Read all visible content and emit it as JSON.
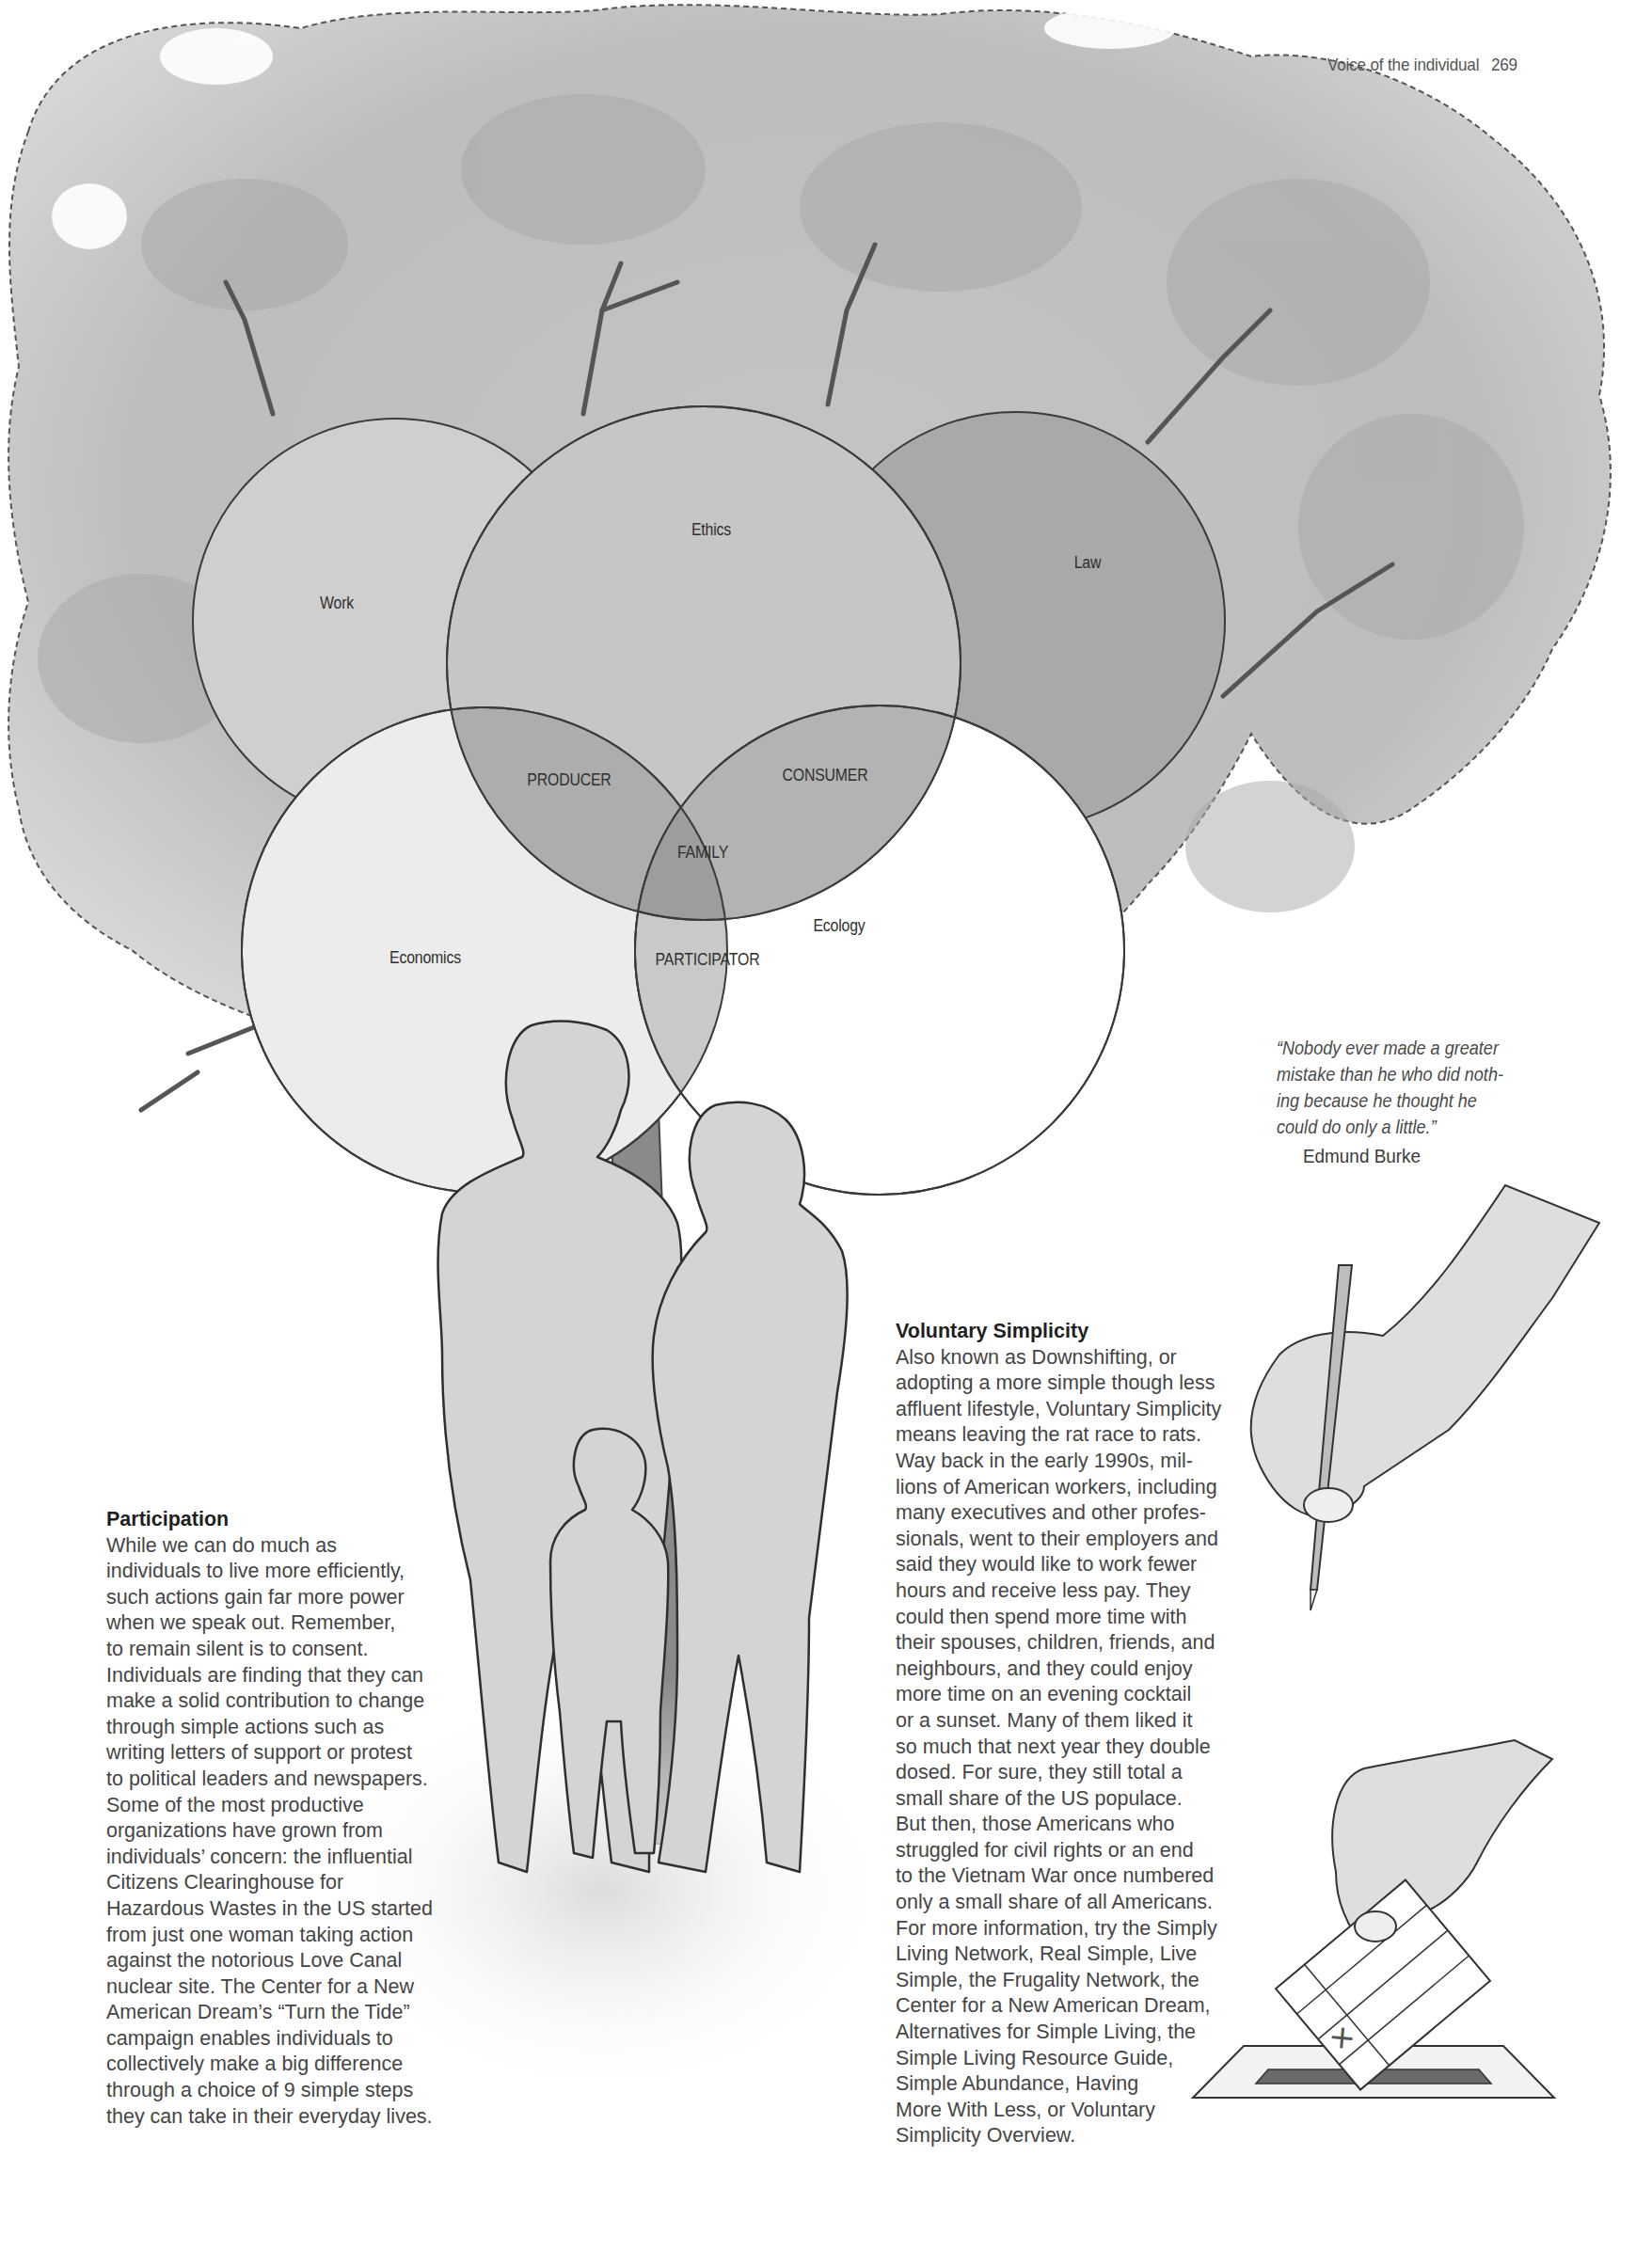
{
  "running_head": {
    "section": "Voice of the individual",
    "page_number": "269"
  },
  "venn_diagram": {
    "circles": [
      {
        "id": "work",
        "label": "Work",
        "fill": "#cfcfcf"
      },
      {
        "id": "ethics",
        "label": "Ethics",
        "fill": "#c6c6c6"
      },
      {
        "id": "law",
        "label": "Law",
        "fill": "#a9a9a9"
      },
      {
        "id": "economics",
        "label": "Economics",
        "fill": "#ececec"
      },
      {
        "id": "ecology",
        "label": "Ecology",
        "fill": "#ffffff"
      }
    ],
    "intersections": [
      {
        "id": "producer",
        "label": "PRODUCER"
      },
      {
        "id": "consumer",
        "label": "CONSUMER"
      },
      {
        "id": "family",
        "label": "FAMILY"
      },
      {
        "id": "participator",
        "label": "PARTICIPATOR"
      }
    ],
    "colors": {
      "outline": "#3a3a3a",
      "overlap_dark": "#a6a6a6",
      "overlap_mid": "#b9b9b9",
      "center": "#9a9a9a"
    }
  },
  "quote": {
    "text": "“Nobody ever made a greater mistake than he who did noth-ing because he thought he could do only a little.”",
    "lines": [
      "“Nobody ever made a greater",
      "mistake than he who did noth-",
      "ing because he thought he",
      "could do only a little.”"
    ],
    "author": "Edmund Burke"
  },
  "participation": {
    "heading": "Participation",
    "body": "While we can do much as\nindividuals to live more efficiently,\nsuch actions gain far more power\nwhen we speak out. Remember,\nto remain silent is to consent.\nIndividuals are finding that they can\nmake a solid contribution to change\nthrough simple actions such as\nwriting letters of support or protest\nto political leaders and newspapers.\nSome of the most productive\norganizations have grown from\nindividuals’ concern: the influential\nCitizens Clearinghouse for\nHazardous Wastes in the US started\nfrom just one woman taking action\nagainst the notorious Love Canal\nnuclear site. The Center for a New\nAmerican Dream’s “Turn the Tide”\ncampaign enables individuals to\ncollectively make a big difference\nthrough a choice of 9 simple steps\nthey can take in their everyday lives."
  },
  "voluntary_simplicity": {
    "heading": "Voluntary Simplicity",
    "body": "Also known as Downshifting, or\nadopting a more simple though less\naffluent lifestyle, Voluntary Simplicity\nmeans leaving the rat race to rats.\nWay back in the early 1990s, mil-\nlions of American workers, including\nmany executives and other profes-\nsionals, went to their employers and\nsaid they would like to work fewer\nhours and receive less pay. They\ncould then spend more time with\ntheir spouses, children, friends, and\nneighbours, and they could enjoy\nmore time on an evening cocktail\nor a sunset. Many of them liked it\nso much that next year they double\ndosed. For sure, they still total a\nsmall share of the US populace.\nBut then, those Americans who\nstruggled for civil rights or an end\nto the Vietnam War once numbered\nonly a small share of all Americans.\nFor more information, try the Simply\nLiving Network, Real Simple, Live\nSimple, the Frugality Network, the\nCenter for a New American Dream,\nAlternatives for Simple Living, the\nSimple Living Resource Guide,\nSimple Abundance, Having\nMore With Less, or Voluntary\nSimplicity Overview."
  },
  "illustrations": {
    "tree": "tree-illustration",
    "family": "family-silhouette-illustration",
    "pencil_hand": "hand-holding-pencil-illustration",
    "ballot": {
      "name": "ballot-box-illustration",
      "ballot_mark": "✕"
    }
  }
}
